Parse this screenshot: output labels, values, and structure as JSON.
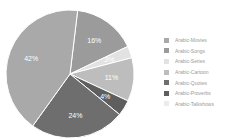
{
  "chart_data": {
    "type": "pie",
    "title": "",
    "categories": [
      "Arabic-Movies",
      "Arabic-Songs",
      "Arabic-Series",
      "Arabic-Cartoon",
      "Arabic-Quotes",
      "Arabic-Proverbs",
      "Arabic-Talkshows"
    ],
    "values": [
      42,
      16,
      3,
      11,
      24,
      4,
      0
    ],
    "labels": [
      "42%",
      "16%",
      "3%",
      "11%",
      "24%",
      "4%",
      ""
    ],
    "colors": [
      "#a9a9a9",
      "#9b9b9b",
      "#e2e2e2",
      "#bdbdbd",
      "#6e6e6e",
      "#5e5e5e",
      "#ececec"
    ],
    "legend_position": "right",
    "slice_order_clockwise_from_top": [
      "Arabic-Songs",
      "Arabic-Series",
      "Arabic-Cartoon",
      "Arabic-Proverbs",
      "Arabic-Quotes",
      "Arabic-Movies"
    ]
  },
  "legend": {
    "items": [
      {
        "label": "Arabic-Movies",
        "color": "#a9a9a9"
      },
      {
        "label": "Arabic-Songs",
        "color": "#9b9b9b"
      },
      {
        "label": "Arabic-Series",
        "color": "#e2e2e2"
      },
      {
        "label": "Arabic-Cartoon",
        "color": "#bdbdbd"
      },
      {
        "label": "Arabic-Quotes",
        "color": "#6e6e6e"
      },
      {
        "label": "Arabic-Proverbs",
        "color": "#5e5e5e"
      },
      {
        "label": "Arabic-Talkshows",
        "color": "#ececec"
      }
    ]
  }
}
